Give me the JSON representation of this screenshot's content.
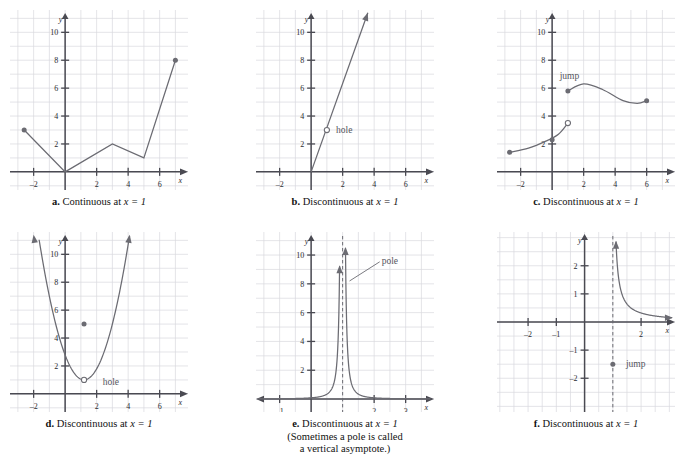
{
  "figure": {
    "title": "",
    "panel_count": 6,
    "stroke_color": "#6b6b72",
    "grid_color": "#d9d9de",
    "axis_color": "#4a4a52"
  },
  "panels": [
    {
      "id": "a",
      "letter": "a.",
      "caption_main": "Continuous at ",
      "caption_math": "x = 1",
      "caption_extra_1": "",
      "caption_extra_2": "",
      "axis_x_label": "x",
      "axis_y_label": "y",
      "x_ticks": [
        "-2",
        "2",
        "4",
        "6"
      ],
      "y_ticks": [
        "2",
        "4",
        "6",
        "8",
        "10"
      ],
      "annotations": [],
      "chart_data": {
        "type": "line",
        "title": "",
        "xlabel": "x",
        "ylabel": "y",
        "xlim": [
          -3.5,
          7.8
        ],
        "ylim": [
          -1.3,
          11.6
        ],
        "grid": true,
        "legend": "none",
        "series": [
          {
            "name": "piecewise-linear",
            "points": [
              [
                -2.6,
                3
              ],
              [
                0,
                0
              ],
              [
                3,
                2
              ],
              [
                5,
                1
              ],
              [
                7,
                8
              ]
            ]
          }
        ],
        "closed_points": [
          [
            -2.6,
            3
          ],
          [
            7,
            8
          ]
        ],
        "open_points": []
      }
    },
    {
      "id": "b",
      "letter": "b.",
      "caption_main": "Discontinuous at ",
      "caption_math": "x = 1",
      "caption_extra_1": "",
      "caption_extra_2": "",
      "axis_x_label": "x",
      "axis_y_label": "y",
      "x_ticks": [
        "-2",
        "2",
        "4",
        "6"
      ],
      "y_ticks": [
        "2",
        "4",
        "6",
        "8",
        "10"
      ],
      "annotations": [
        {
          "text": "hole",
          "x": 1.2,
          "y": 3
        }
      ],
      "chart_data": {
        "type": "line",
        "title": "",
        "xlabel": "x",
        "ylabel": "y",
        "xlim": [
          -3.5,
          7.8
        ],
        "ylim": [
          -1.3,
          11.6
        ],
        "grid": true,
        "legend": "none",
        "series": [
          {
            "name": "steep-line",
            "points": [
              [
                0,
                0
              ],
              [
                3.6,
                11.4
              ]
            ]
          }
        ],
        "closed_points": [],
        "open_points": [
          [
            1.0,
            3.0
          ]
        ],
        "arrow_end": [
          3.6,
          11.4
        ]
      }
    },
    {
      "id": "c",
      "letter": "c.",
      "caption_main": "Discontinuous at ",
      "caption_math": "x = 1",
      "caption_extra_1": "",
      "caption_extra_2": "",
      "axis_x_label": "x",
      "axis_y_label": "y",
      "x_ticks": [
        "-2",
        "2",
        "4",
        "6"
      ],
      "y_ticks": [
        "2",
        "4",
        "6",
        "8",
        "10"
      ],
      "annotations": [
        {
          "text": "jump",
          "x": 1.1,
          "y": 6.9
        }
      ],
      "chart_data": {
        "type": "line",
        "title": "",
        "xlabel": "x",
        "ylabel": "y",
        "xlim": [
          -3.5,
          7.8
        ],
        "ylim": [
          -1.3,
          11.6
        ],
        "grid": true,
        "legend": "none",
        "series": [
          {
            "name": "left-branch",
            "points": [
              [
                -2.7,
                1.4
              ],
              [
                -1.5,
                1.7
              ],
              [
                -0.4,
                2.2
              ],
              [
                0.4,
                2.7
              ],
              [
                1.0,
                3.5
              ]
            ]
          },
          {
            "name": "right-branch",
            "points": [
              [
                1.0,
                5.8
              ],
              [
                2.0,
                6.3
              ],
              [
                3.2,
                5.9
              ],
              [
                4.5,
                5.1
              ],
              [
                5.4,
                4.9
              ],
              [
                6.0,
                5.1
              ]
            ]
          }
        ],
        "closed_points": [
          [
            -2.7,
            1.4
          ],
          [
            1.0,
            5.8
          ],
          [
            6.0,
            5.1
          ],
          [
            0.0,
            2.3
          ]
        ],
        "open_points": [
          [
            1.0,
            3.5
          ]
        ]
      }
    },
    {
      "id": "d",
      "letter": "d.",
      "caption_main": "Discontinuous at ",
      "caption_math": "x = 1",
      "caption_extra_1": "",
      "caption_extra_2": "",
      "axis_x_label": "x",
      "axis_y_label": "y",
      "x_ticks": [
        "-2",
        "2",
        "4",
        "6"
      ],
      "y_ticks": [
        "2",
        "4",
        "6",
        "8",
        "10"
      ],
      "annotations": [
        {
          "text": "hole",
          "x": 2.0,
          "y": 0.85
        }
      ],
      "chart_data": {
        "type": "line",
        "title": "",
        "xlabel": "x",
        "ylabel": "y",
        "xlim": [
          -3.5,
          7.8
        ],
        "ylim": [
          -1.3,
          11.6
        ],
        "grid": true,
        "legend": "none",
        "series": [
          {
            "name": "parabola",
            "equation": "y = (x-1)^2 + 1 (hole at x=1)",
            "vertex": [
              1.2,
              1.0
            ],
            "x_start": -2.0,
            "x_end": 4.1
          }
        ],
        "closed_points": [
          [
            1.2,
            5.0
          ]
        ],
        "open_points": [
          [
            1.2,
            1.0
          ]
        ],
        "arrow_ends": [
          [
            -2.0,
            11.4
          ],
          [
            4.1,
            11.4
          ]
        ]
      }
    },
    {
      "id": "e",
      "letter": "e.",
      "caption_main": "Discontinuous at ",
      "caption_math": "x = 1",
      "caption_extra_1": "(Sometimes a pole is called",
      "caption_extra_2": "a vertical asymptote.)",
      "axis_x_label": "x",
      "axis_y_label": "y",
      "x_ticks": [
        "-1",
        "2",
        "3"
      ],
      "y_ticks": [
        "2",
        "4",
        "6",
        "8",
        "10"
      ],
      "annotations": [
        {
          "text": "pole",
          "x": 2.05,
          "y": 9.6
        }
      ],
      "chart_data": {
        "type": "line",
        "title": "",
        "xlabel": "x",
        "ylabel": "y",
        "xlim": [
          -1.75,
          3.9
        ],
        "ylim": [
          -0.9,
          11.6
        ],
        "grid": true,
        "legend": "none",
        "asymptote_x": 1.0,
        "series": [
          {
            "name": "pole-left",
            "equation": "y = 0.085/(x-1)^2",
            "x_start": -1.7,
            "x_end": 0.91
          },
          {
            "name": "pole-right",
            "equation": "y = 0.085/(x-1)^2",
            "x_start": 1.09,
            "x_end": 3.8
          }
        ],
        "closed_points": [],
        "open_points": []
      }
    },
    {
      "id": "f",
      "letter": "f.",
      "caption_main": "Discontinuous at ",
      "caption_math": "x = 1",
      "caption_extra_1": "",
      "caption_extra_2": "",
      "axis_x_label": "x",
      "axis_y_label": "y",
      "x_ticks": [
        "-2",
        "-1",
        "2"
      ],
      "y_ticks": [
        "2",
        "1",
        "-1",
        "-2"
      ],
      "annotations": [
        {
          "text": "jump",
          "x": 1.25,
          "y": -1.5
        }
      ],
      "chart_data": {
        "type": "line",
        "title": "",
        "xlabel": "x",
        "ylabel": "y",
        "xlim": [
          -3.1,
          3.2
        ],
        "ylim": [
          -3.2,
          3.2
        ],
        "grid": true,
        "legend": "none",
        "asymptote_x": 1.0,
        "series": [
          {
            "name": "hyperbola-right",
            "equation": "y = 0.32/(x-1)",
            "x_start": 1.1,
            "x_end": 3.1
          }
        ],
        "closed_points": [
          [
            1.0,
            -1.5
          ]
        ],
        "open_points": []
      }
    }
  ]
}
